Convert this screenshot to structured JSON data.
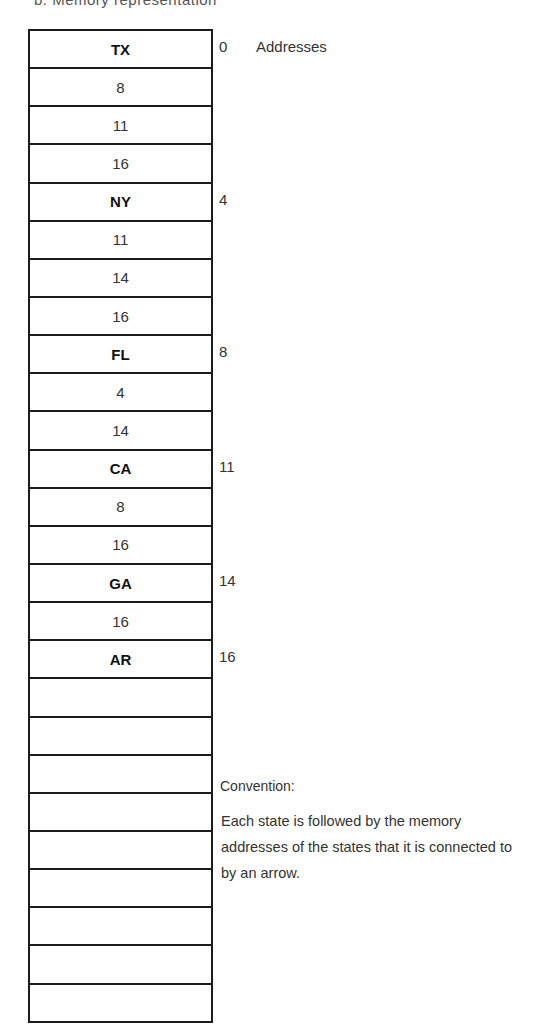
{
  "caption": "b. Memory representation",
  "address_header": "Addresses",
  "cells": [
    {
      "text": "TX",
      "kind": "state",
      "address": "0"
    },
    {
      "text": "8",
      "kind": "pointer"
    },
    {
      "text": "11",
      "kind": "pointer"
    },
    {
      "text": "16",
      "kind": "pointer"
    },
    {
      "text": "NY",
      "kind": "state",
      "address": "4"
    },
    {
      "text": "11",
      "kind": "pointer"
    },
    {
      "text": "14",
      "kind": "pointer"
    },
    {
      "text": "16",
      "kind": "pointer"
    },
    {
      "text": "FL",
      "kind": "state",
      "address": "8"
    },
    {
      "text": "4",
      "kind": "pointer"
    },
    {
      "text": "14",
      "kind": "pointer"
    },
    {
      "text": "CA",
      "kind": "state",
      "address": "11"
    },
    {
      "text": "8",
      "kind": "pointer"
    },
    {
      "text": "16",
      "kind": "pointer"
    },
    {
      "text": "GA",
      "kind": "state",
      "address": "14"
    },
    {
      "text": "16",
      "kind": "pointer"
    },
    {
      "text": "AR",
      "kind": "state",
      "address": "16"
    },
    {
      "text": "",
      "kind": "empty"
    },
    {
      "text": "",
      "kind": "empty"
    },
    {
      "text": "",
      "kind": "empty"
    },
    {
      "text": "",
      "kind": "empty"
    },
    {
      "text": "",
      "kind": "empty"
    },
    {
      "text": "",
      "kind": "empty"
    },
    {
      "text": "",
      "kind": "empty"
    },
    {
      "text": "",
      "kind": "empty"
    },
    {
      "text": "",
      "kind": "empty"
    }
  ],
  "convention": {
    "title": "Convention:",
    "text": "Each state is followed by the memory addresses of the states that it is connected to by an arrow."
  }
}
